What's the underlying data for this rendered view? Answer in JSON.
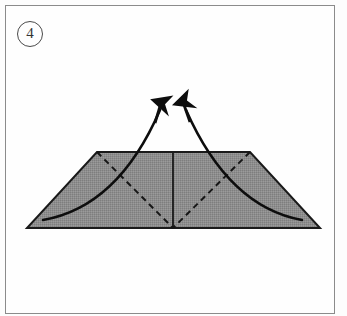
{
  "diagram": {
    "kind": "origami-fold-step",
    "step_number": "4",
    "step_label_shape": "circled-number",
    "caption": "",
    "background_color": "#fdfdfd",
    "frame": {
      "border_color": "#8b8b8b",
      "fill_color": "#fefefe"
    },
    "shape": {
      "name": "trapezoid",
      "fill_color": "#8a8a8a",
      "fill_texture": "halftone-dither",
      "outline_color": "#1a1a1a",
      "outline_width": 2,
      "vertices": [
        {
          "x": 97,
          "y": 152
        },
        {
          "x": 250,
          "y": 152
        },
        {
          "x": 320,
          "y": 228
        },
        {
          "x": 27,
          "y": 228
        }
      ]
    },
    "creases": [
      {
        "name": "center-vertical-crease",
        "style": "solid",
        "color": "#111111",
        "from": {
          "x": 173,
          "y": 153
        },
        "to": {
          "x": 173,
          "y": 227
        }
      },
      {
        "name": "left-diagonal-fold-line",
        "style": "dashed",
        "color": "#161616",
        "from": {
          "x": 97,
          "y": 152
        },
        "to": {
          "x": 173,
          "y": 228
        }
      },
      {
        "name": "right-diagonal-fold-line",
        "style": "dashed",
        "color": "#161616",
        "from": {
          "x": 250,
          "y": 152
        },
        "to": {
          "x": 173,
          "y": 228
        }
      }
    ],
    "curves": [
      {
        "name": "left-fold-sweep-curve",
        "style": "solid",
        "color": "#0d0d0d",
        "from": {
          "x": 43,
          "y": 220
        },
        "control": {
          "x": 118,
          "y": 207
        },
        "to": {
          "x": 160,
          "y": 110
        }
      },
      {
        "name": "right-fold-sweep-curve",
        "style": "solid",
        "color": "#0d0d0d",
        "from": {
          "x": 302,
          "y": 220
        },
        "control": {
          "x": 229,
          "y": 207
        },
        "to": {
          "x": 186,
          "y": 110
        }
      }
    ],
    "arrows": [
      {
        "name": "left-fold-arrow",
        "direction": "up-left",
        "color": "#0d0d0d",
        "tail": {
          "x": 43,
          "y": 220
        },
        "tip": {
          "x": 160,
          "y": 96
        }
      },
      {
        "name": "right-fold-arrow",
        "direction": "up-right",
        "color": "#0d0d0d",
        "tail": {
          "x": 302,
          "y": 220
        },
        "tip": {
          "x": 182,
          "y": 95
        }
      }
    ]
  }
}
